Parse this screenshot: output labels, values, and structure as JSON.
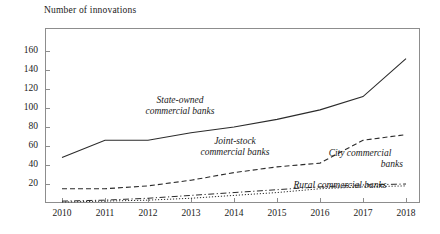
{
  "chart_data": {
    "type": "line",
    "title": "",
    "ylabel": "Number of innovations",
    "xlabel": "",
    "categories": [
      "2010",
      "2011",
      "2012",
      "2013",
      "2014",
      "2015",
      "2016",
      "2017",
      "2018"
    ],
    "x": [
      2010,
      2011,
      2012,
      2013,
      2014,
      2015,
      2016,
      2017,
      2018
    ],
    "ylim": [
      0,
      170
    ],
    "yticks": [
      20,
      40,
      60,
      80,
      100,
      120,
      140,
      160
    ],
    "grid": false,
    "legend_position": "inline-annotations",
    "series": [
      {
        "name": "State-owned commercial banks",
        "style": "solid",
        "values": [
          48,
          66,
          66,
          74,
          80,
          88,
          98,
          112,
          152
        ]
      },
      {
        "name": "Joint-stock commercial banks",
        "style": "dashed",
        "values": [
          15,
          15,
          18,
          24,
          32,
          38,
          42,
          66,
          72
        ]
      },
      {
        "name": "City commercial banks",
        "style": "dash-dot",
        "values": [
          2,
          3,
          5,
          8,
          11,
          14,
          17,
          19,
          20
        ]
      },
      {
        "name": "Rural commercial banks",
        "style": "dotted",
        "values": [
          1,
          2,
          3,
          5,
          8,
          11,
          15,
          17,
          18
        ]
      }
    ]
  },
  "axis": {
    "y_title": "Number of innovations",
    "y_tick_labels": [
      "160",
      "140",
      "120",
      "100",
      "80",
      "60",
      "40",
      "20"
    ],
    "x_tick_labels": [
      "2010",
      "2011",
      "2012",
      "2013",
      "2014",
      "2015",
      "2016",
      "2017",
      "2018"
    ]
  },
  "annotations": {
    "state_owned_line1": "State-owned",
    "state_owned_line2": "commercial banks",
    "joint_stock_line1": "Joint-stock",
    "joint_stock_line2": "commercial banks",
    "city_line1": "City commercial",
    "city_line2": "banks",
    "rural_line1": "Rural commercial banks"
  },
  "colors": {
    "ink": "#1a1a1a",
    "frame": "#8d8d8d",
    "line": "#2b2b2b",
    "background": "#ffffff"
  }
}
